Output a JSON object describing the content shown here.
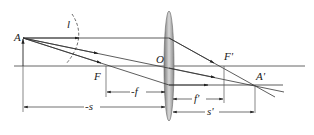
{
  "diagram": {
    "type": "thin-lens-ray-diagram",
    "labels": {
      "object": "A",
      "image": "A'",
      "optical_center": "O",
      "front_focus": "F",
      "back_focus": "F'",
      "object_height": "l",
      "front_focal_length": "-f",
      "back_focal_length": "f'",
      "object_distance": "-s",
      "image_distance": "s'"
    },
    "colors": {
      "line": "#333333",
      "lens_edge": "#666666",
      "lens_fill": "#b8b8b8"
    }
  }
}
